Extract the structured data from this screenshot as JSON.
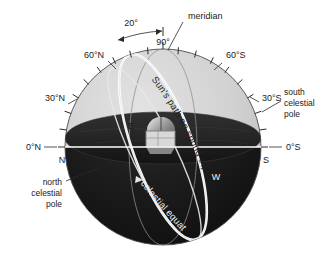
{
  "figure": {
    "type": "celestial-sphere-diagram",
    "background_color": "#ffffff",
    "sky_hemisphere_color": "#cfcfcf",
    "ground_hemisphere_color": "#181818",
    "line_color_light": "#f2f2f2",
    "line_color_dark": "#2a2a2a",
    "text_color": "#1a1a1a"
  },
  "labels": {
    "angle_span": "20°",
    "zenith_angle": "90°",
    "meridian": "meridian",
    "north_60": "60°N",
    "north_30": "30°N",
    "north_0": "0°N",
    "south_60": "60°S",
    "south_30": "30°S",
    "south_0": "0°S",
    "cardinal_north": "N",
    "cardinal_south": "S",
    "cardinal_east": "E",
    "cardinal_west": "W",
    "sun_path": "Sun's path on spring equinox",
    "celestial_equator": "celestial equator",
    "north_celestial_pole": {
      "line1": "north",
      "line2": "celestial",
      "line3": "pole"
    },
    "south_celestial_pole": {
      "line1": "south",
      "line2": "celestial",
      "line3": "pole"
    }
  },
  "geometry": {
    "sphere_center_x": 163,
    "sphere_center_y": 147,
    "sphere_radius": 98,
    "horizon_y": 147,
    "tick_interval_degrees": 10
  }
}
